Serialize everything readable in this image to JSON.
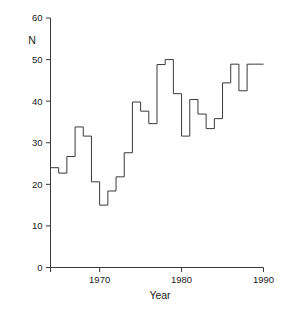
{
  "chart_data": {
    "type": "line",
    "step": "post",
    "title": "",
    "subtitle": "",
    "xlabel": "Year",
    "ylabel": "N",
    "xlim": [
      1964,
      1990
    ],
    "ylim": [
      0,
      60
    ],
    "grid": false,
    "legend": null,
    "xticks": [
      1970,
      1980,
      1990
    ],
    "xtick_labels": [
      "1970",
      "1980",
      "1990"
    ],
    "yticks": [
      0,
      10,
      20,
      30,
      40,
      50,
      60
    ],
    "ytick_labels": [
      "0",
      "10",
      "20",
      "30",
      "40",
      "50",
      "60"
    ],
    "x": [
      1964,
      1965,
      1966,
      1967,
      1968,
      1969,
      1970,
      1971,
      1972,
      1973,
      1974,
      1975,
      1976,
      1977,
      1978,
      1979,
      1980,
      1981,
      1982,
      1983,
      1984,
      1985,
      1986,
      1987,
      1988,
      1989
    ],
    "values": [
      24.0,
      22.7,
      26.7,
      33.8,
      31.6,
      20.6,
      15.0,
      18.4,
      21.8,
      27.6,
      39.8,
      37.6,
      34.6,
      48.8,
      50.0,
      41.8,
      31.6,
      40.4,
      36.9,
      33.4,
      35.8,
      44.4,
      48.9,
      42.5,
      48.9,
      48.9
    ],
    "series": [
      {
        "name": "N",
        "values": [
          24.0,
          22.7,
          26.7,
          33.8,
          31.6,
          20.6,
          15.0,
          18.4,
          21.8,
          27.6,
          39.8,
          37.6,
          34.6,
          48.8,
          50.0,
          41.8,
          31.6,
          40.4,
          36.9,
          33.4,
          35.8,
          44.4,
          48.9,
          42.5,
          48.9,
          48.9
        ]
      }
    ],
    "line_color": "#3a3a3a",
    "background_color": "#ffffff"
  },
  "axes": {
    "y_axis_label": "N",
    "x_axis_label": "Year"
  }
}
